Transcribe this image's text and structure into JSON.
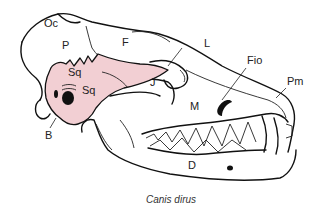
{
  "figure": {
    "caption": "Canis dirus",
    "highlight_color": "#f2cfd3",
    "line_color": "#111111"
  },
  "labels": {
    "oc": "Oc",
    "p": "P",
    "f": "F",
    "sq_upper": "Sq",
    "sq_lower": "Sq",
    "j": "J",
    "l": "L",
    "fio": "Fio",
    "pm": "Pm",
    "m": "M",
    "b": "B",
    "d": "D"
  }
}
